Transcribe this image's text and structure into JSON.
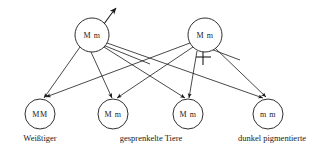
{
  "diagram": {
    "stroke_color": "#1a1a1a",
    "background_color": "#ffffff",
    "parents": [
      {
        "id": "father",
        "genotype": "M m",
        "sex_symbol": "male-arrow",
        "cx": 92,
        "cy": 35,
        "r": 17
      },
      {
        "id": "mother",
        "genotype": "M m",
        "sex_symbol": "female-cross",
        "cx": 205,
        "cy": 35,
        "r": 17
      }
    ],
    "offspring": [
      {
        "id": "offspring-1",
        "genotype": "MM",
        "cx": 40,
        "cy": 114,
        "r": 15
      },
      {
        "id": "offspring-2",
        "genotype": "M m",
        "cx": 113,
        "cy": 114,
        "r": 15
      },
      {
        "id": "offspring-3",
        "genotype": "M m",
        "cx": 188,
        "cy": 114,
        "r": 15
      },
      {
        "id": "offspring-4",
        "genotype": "m m",
        "cx": 268,
        "cy": 114,
        "r": 15
      }
    ],
    "captions": [
      {
        "id": "caption-weisstiger",
        "text": "Weißtiger",
        "x": 40,
        "y": 141
      },
      {
        "id": "caption-gesprenkelte",
        "text": "gesprenkelte Tiere",
        "x": 151,
        "y": 141
      },
      {
        "id": "caption-dunkel",
        "text": "dunkel pigmentierte",
        "x": 272,
        "y": 141
      }
    ],
    "edges": [
      {
        "from": "father",
        "to": "offspring-1"
      },
      {
        "from": "father",
        "to": "offspring-2"
      },
      {
        "from": "father",
        "to": "offspring-3"
      },
      {
        "from": "father",
        "to": "offspring-4"
      },
      {
        "from": "mother",
        "to": "offspring-1"
      },
      {
        "from": "mother",
        "to": "offspring-2"
      },
      {
        "from": "mother",
        "to": "offspring-3"
      },
      {
        "from": "mother",
        "to": "offspring-4"
      }
    ]
  }
}
